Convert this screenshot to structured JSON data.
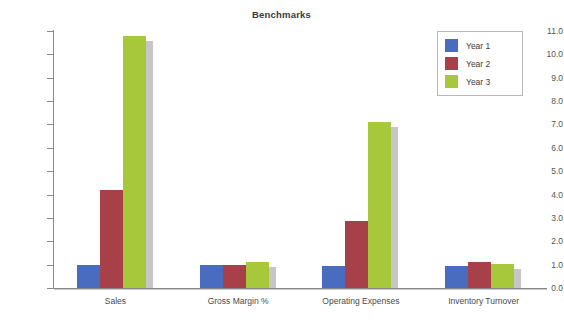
{
  "chart_data": {
    "type": "bar",
    "title": "Benchmarks",
    "xlabel": "",
    "ylabel": "",
    "ylim": [
      0.0,
      11.0
    ],
    "ytick_step": 1.0,
    "ytick_labels": [
      "0.0",
      "1.0",
      "2.0",
      "3.0",
      "4.0",
      "5.0",
      "6.0",
      "7.0",
      "8.0",
      "9.0",
      "10.0",
      "11.0"
    ],
    "grid": false,
    "legend_position": "upper-right",
    "categories": [
      "Sales",
      "Gross Margin %",
      "Operating Expenses",
      "Inventory Turnover"
    ],
    "series": [
      {
        "name": "Year 1",
        "color": "#4a6cc0",
        "values": [
          1.0,
          0.97,
          0.95,
          0.93
        ]
      },
      {
        "name": "Year 2",
        "color": "#a8404a",
        "values": [
          4.2,
          0.97,
          2.85,
          1.12
        ]
      },
      {
        "name": "Year 3",
        "color": "#a8c83c",
        "values": [
          10.8,
          1.1,
          7.1,
          1.02
        ]
      }
    ]
  },
  "colors": {
    "year1": "#4a6cc0",
    "year2": "#a8404a",
    "year3": "#a8c83c",
    "shadow": "#c6c6c6",
    "axis": "#888888",
    "title_text": "#3a3a3a",
    "tick_text": "#555555",
    "background": "#ffffff"
  }
}
